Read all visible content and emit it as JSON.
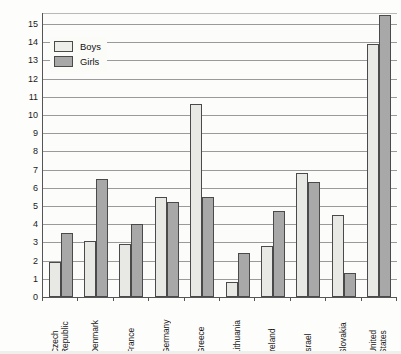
{
  "chart_data": {
    "type": "bar",
    "title": "",
    "xlabel": "",
    "ylabel": "Percentage of 15-year-olds who are obese",
    "ylim": [
      0,
      15.6
    ],
    "ytick_labels": [
      "0",
      "1",
      "2",
      "3",
      "4",
      "5",
      "6",
      "7",
      "8",
      "9",
      "10",
      "11",
      "12",
      "13",
      "14",
      "15"
    ],
    "ytick_values": [
      0,
      1,
      2,
      3,
      4,
      5,
      6,
      7,
      8,
      9,
      10,
      11,
      12,
      13,
      14,
      15
    ],
    "grid": true,
    "legend_position": "upper-left",
    "categories": [
      "Czech Republic",
      "Denmark",
      "France",
      "Germany",
      "Greece",
      "Lithuania",
      "Ireland",
      "Israel",
      "Slovakia",
      "United States"
    ],
    "category_words": [
      [
        "Czech",
        "Republic"
      ],
      [
        "Denmark"
      ],
      [
        "France"
      ],
      [
        "Germany"
      ],
      [
        "Greece"
      ],
      [
        "Lithuania"
      ],
      [
        "Ireland"
      ],
      [
        "Israel"
      ],
      [
        "Slovakia"
      ],
      [
        "United",
        "States"
      ]
    ],
    "series": [
      {
        "name": "Boys",
        "color": "#e8e8e5",
        "values": [
          1.9,
          3.1,
          2.9,
          5.5,
          10.6,
          0.8,
          2.8,
          6.8,
          4.5,
          13.9
        ]
      },
      {
        "name": "Girls",
        "color": "#a8a8a8",
        "values": [
          3.5,
          6.5,
          4.0,
          5.2,
          5.5,
          2.4,
          4.7,
          6.3,
          1.3,
          15.5
        ]
      }
    ]
  },
  "legend": {
    "items": [
      {
        "label": "Boys",
        "swatch": "boys"
      },
      {
        "label": "Girls",
        "swatch": "girls"
      }
    ]
  }
}
